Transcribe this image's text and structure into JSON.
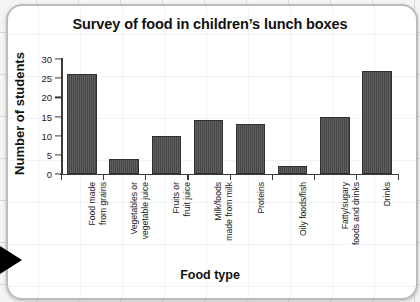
{
  "chart_data": {
    "type": "bar",
    "title": "Survey of food in children’s lunch boxes",
    "xlabel": "Food type",
    "ylabel": "Number of students",
    "categories": [
      "Food made\nfrom grains",
      "Vegetables or\nvegetable juice",
      "Fruits or\nfruit juice",
      "Milk/foods\nmade from milk",
      "Proteins",
      "Oily foods/fish",
      "Fatty/sugary\nfoods and drinks",
      "Drinks"
    ],
    "values": [
      26,
      4,
      10,
      14,
      13,
      2,
      15,
      27
    ],
    "ylim": [
      0,
      30
    ],
    "yticks": [
      0,
      5,
      10,
      15,
      20,
      25,
      30
    ],
    "ytick_labels": [
      "0",
      "5",
      "10",
      "15",
      "20",
      "25",
      "30"
    ],
    "grid": false,
    "legend": null,
    "bar_color": "#4c4c4c",
    "axis_color": "#3a3a3a"
  },
  "page": {
    "background_color": "#f4f4f2",
    "card_color": "#ffffff",
    "card_border_color": "#b9bcbd",
    "arrow_color": "#000000"
  }
}
